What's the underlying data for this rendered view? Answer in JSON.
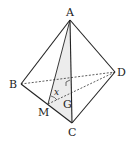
{
  "diagram": {
    "type": "tetrahedron",
    "vertices": {
      "A": {
        "label": "A",
        "x": 70,
        "y": 20
      },
      "B": {
        "label": "B",
        "x": 21,
        "y": 84
      },
      "C": {
        "label": "C",
        "x": 72,
        "y": 123
      },
      "D": {
        "label": "D",
        "x": 115,
        "y": 72
      },
      "M": {
        "label": "M",
        "x": 48,
        "y": 104
      },
      "G": {
        "label": "G",
        "x": 70,
        "y": 90
      }
    },
    "angle_label": "x",
    "shaded_face": "AMC",
    "solid_edges": [
      "AB",
      "AC",
      "AD",
      "BC",
      "CD",
      "AM"
    ],
    "dashed_edges": [
      "BD",
      "MD"
    ],
    "right_angle_at": "G",
    "colors": {
      "stroke": "#222222",
      "shade": "#ececec"
    }
  }
}
